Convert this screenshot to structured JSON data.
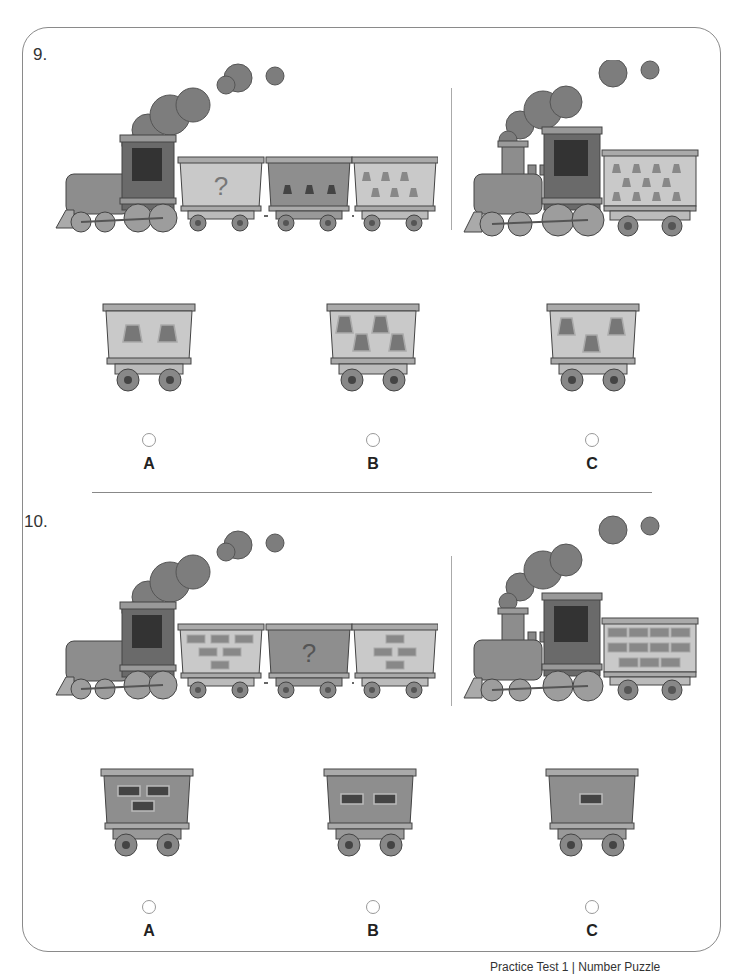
{
  "page": {
    "footer_text": "Practice Test 1 | Number Puzzle"
  },
  "colors": {
    "frame": "#8a8a8a",
    "car_light": "#c9c9c9",
    "car_dark": "#8e8e8e",
    "shape_fill": "#6f6f6f",
    "smoke": "#7d7d7d",
    "engine_body": "#8d8d8d",
    "cab": "#6a6a6a",
    "window": "#333333"
  },
  "questions": [
    {
      "number": "9.",
      "sequence": {
        "engine": "steam-locomotive",
        "cars": [
          {
            "color": "light",
            "content": "?",
            "pattern": "question-mark"
          },
          {
            "color": "dark",
            "pattern": "trapezoids",
            "count": 3
          },
          {
            "color": "light",
            "pattern": "trapezoids",
            "count": 6
          }
        ]
      },
      "example": {
        "engine": "steam-locomotive",
        "cars": [
          {
            "color": "light",
            "pattern": "trapezoids",
            "count": 11
          }
        ]
      },
      "options": [
        {
          "letter": "A",
          "color": "light",
          "pattern": "trapezoids",
          "count": 2
        },
        {
          "letter": "B",
          "color": "light",
          "pattern": "trapezoids",
          "count": 4
        },
        {
          "letter": "C",
          "color": "light",
          "pattern": "trapezoids",
          "count": 3
        }
      ]
    },
    {
      "number": "10.",
      "sequence": {
        "engine": "steam-locomotive",
        "cars": [
          {
            "color": "light",
            "pattern": "bricks",
            "count": 6
          },
          {
            "color": "dark",
            "content": "?",
            "pattern": "question-mark"
          },
          {
            "color": "light",
            "pattern": "bricks",
            "count": 4
          }
        ]
      },
      "example": {
        "engine": "steam-locomotive",
        "cars": [
          {
            "color": "light",
            "pattern": "bricks",
            "count": 11
          }
        ]
      },
      "options": [
        {
          "letter": "A",
          "color": "dark",
          "pattern": "bricks",
          "count": 3
        },
        {
          "letter": "B",
          "color": "dark",
          "pattern": "bricks",
          "count": 2
        },
        {
          "letter": "C",
          "color": "dark",
          "pattern": "bricks",
          "count": 1
        }
      ]
    }
  ]
}
